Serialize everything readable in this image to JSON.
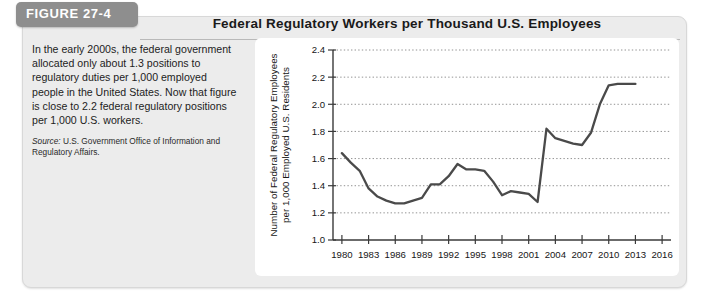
{
  "figure": {
    "tab_label": "FIGURE 27-4",
    "title": "Federal Regulatory Workers per Thousand U.S. Employees",
    "caption": "In the early 2000s, the federal government allocated only about 1.3 positions to regulatory duties per 1,000 employed people in the United States. Now that figure is close to 2.2 federal regulatory positions per 1,000 U.S. workers.",
    "source_label": "Source:",
    "source_text": "U.S. Government Office of Information and Regulatory Affairs."
  },
  "colors": {
    "panel_background": "#ececec",
    "tab_background": "#8e8e8e",
    "plot_background": "#ffffff",
    "line": "#4a4a4a",
    "grid": "#777777",
    "axis": "#3a3a3a"
  },
  "chart_data": {
    "type": "line",
    "title": "Federal Regulatory Workers per Thousand U.S. Employees",
    "xlabel": "",
    "ylabel": "Number of Federal Regulatory Employees per 1,000 Employed U.S. Residents",
    "ylabel_line1": "Number of Federal Regulatory Employees",
    "ylabel_line2": "per 1,000 Employed U.S. Residents",
    "xlim": [
      1979,
      2017
    ],
    "ylim": [
      1.0,
      2.4
    ],
    "ytick_labels": [
      "1.0",
      "1.2",
      "1.4",
      "1.6",
      "1.8",
      "2.0",
      "2.2",
      "2.4"
    ],
    "yticks": [
      1.0,
      1.2,
      1.4,
      1.6,
      1.8,
      2.0,
      2.2,
      2.4
    ],
    "xtick_labels": [
      "1980",
      "1983",
      "1986",
      "1989",
      "1992",
      "1995",
      "1998",
      "2001",
      "2004",
      "2007",
      "2010",
      "2013",
      "2016"
    ],
    "xticks": [
      1980,
      1983,
      1986,
      1989,
      1992,
      1995,
      1998,
      2001,
      2004,
      2007,
      2010,
      2013,
      2016
    ],
    "grid": true,
    "grid_axis": "y",
    "legend": false,
    "x": [
      1980,
      1981,
      1982,
      1983,
      1984,
      1985,
      1986,
      1987,
      1988,
      1989,
      1990,
      1991,
      1992,
      1993,
      1994,
      1995,
      1996,
      1997,
      1998,
      1999,
      2000,
      2001,
      2002,
      2003,
      2004,
      2005,
      2006,
      2007,
      2008,
      2009,
      2010,
      2011,
      2012,
      2013
    ],
    "values": [
      1.64,
      1.57,
      1.51,
      1.38,
      1.32,
      1.29,
      1.27,
      1.27,
      1.29,
      1.31,
      1.41,
      1.41,
      1.47,
      1.56,
      1.52,
      1.52,
      1.51,
      1.43,
      1.33,
      1.36,
      1.35,
      1.34,
      1.28,
      1.82,
      1.75,
      1.73,
      1.71,
      1.7,
      1.79,
      2.0,
      2.14,
      2.15,
      2.15,
      2.15
    ]
  }
}
